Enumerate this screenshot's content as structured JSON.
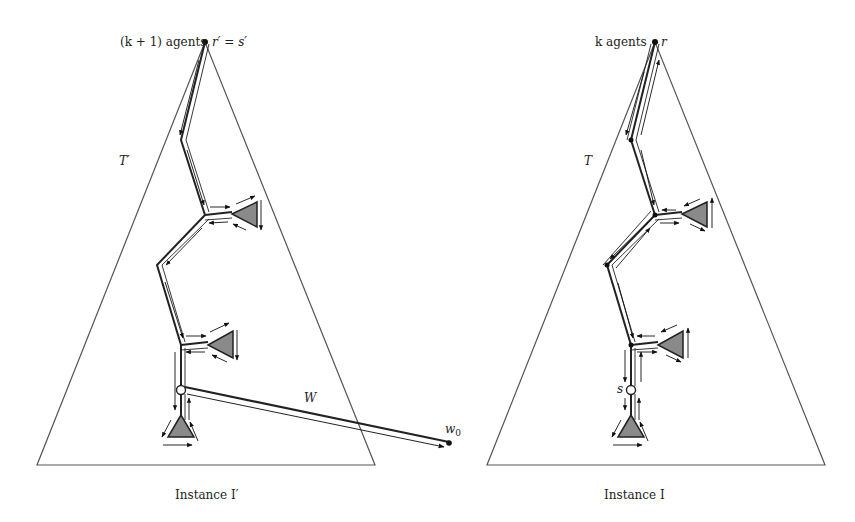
{
  "left_panel": {
    "agents_label": "(k + 1) agents",
    "root_label": "r′ = s′",
    "tree_label": "T′",
    "walk_label": "W",
    "walk_end_label": "w",
    "walk_end_subscript": "0",
    "caption": "Instance I′"
  },
  "right_panel": {
    "agents_label": "k agents",
    "root_label": "r",
    "tree_label": "T",
    "start_label": "s",
    "caption": "Instance I"
  },
  "colors": {
    "line": "#222222",
    "triangle_outline": "#555555",
    "subtree_fill": "#8a8a8a"
  }
}
